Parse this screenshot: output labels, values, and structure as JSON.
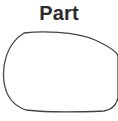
{
  "title": "Part",
  "figure": {
    "icon": "mirror-glass-outline-icon",
    "stroke_color": "#444444"
  }
}
